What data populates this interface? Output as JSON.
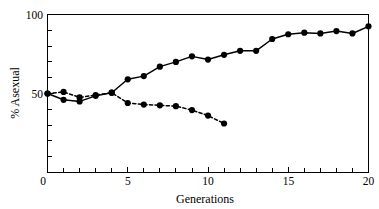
{
  "chart_data": {
    "type": "line",
    "title": "",
    "subtitle": "",
    "xlabel": "Generations",
    "ylabel": "% Asexual",
    "xlim": [
      0,
      20
    ],
    "ylim": [
      0,
      100
    ],
    "grid": false,
    "legend": "none",
    "x_ticks_major": [
      0,
      5,
      10,
      15,
      20
    ],
    "x_tick_labels": [
      "0",
      "5",
      "10",
      "15",
      "20"
    ],
    "x_ticks_minor": [
      1,
      2,
      3,
      4,
      6,
      7,
      8,
      9,
      11,
      12,
      13,
      14,
      16,
      17,
      18,
      19
    ],
    "y_ticks_major": [
      0,
      50,
      100
    ],
    "y_tick_labels": [
      "0",
      "50",
      "100"
    ],
    "y_ticks_minor": [
      10,
      20,
      30,
      40,
      60,
      70,
      80,
      90
    ],
    "series": [
      {
        "name": "rising-population",
        "style": "solid",
        "marker": "filled-circle",
        "x": [
          0,
          1,
          2,
          3,
          4,
          5,
          6,
          7,
          8,
          9,
          10,
          11,
          12,
          13,
          14,
          15,
          16,
          17,
          18,
          19,
          20
        ],
        "values": [
          50,
          46,
          45,
          48.5,
          50.5,
          59,
          61,
          67,
          70,
          73.5,
          71.5,
          74.5,
          77,
          77,
          84.5,
          87.5,
          88.5,
          88,
          89.5,
          88,
          92.5
        ]
      },
      {
        "name": "declining-population",
        "style": "dashed",
        "marker": "filled-circle",
        "x": [
          0,
          1,
          2,
          3,
          4,
          5,
          6,
          7,
          8,
          9,
          10,
          11
        ],
        "values": [
          50,
          51,
          47.5,
          49,
          50.5,
          44,
          43,
          42.5,
          42,
          39.5,
          36,
          31
        ]
      }
    ]
  },
  "axis_labels": {
    "y_title": "% Asexual",
    "x_title": "Generations",
    "y_100": "100",
    "y_50": "50",
    "y_0": "0",
    "x_0": "0",
    "x_5": "5",
    "x_10": "10",
    "x_15": "15",
    "x_20": "20"
  },
  "colors": {
    "ink": "#000000",
    "background": "#ffffff"
  }
}
